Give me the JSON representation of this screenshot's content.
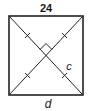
{
  "diagram": {
    "type": "geometry",
    "shape": "square",
    "labels": {
      "top_side": "24",
      "bottom_label": "d",
      "half_diagonal": "c"
    },
    "colors": {
      "stroke": "#222222",
      "background": "#ffffff"
    }
  }
}
